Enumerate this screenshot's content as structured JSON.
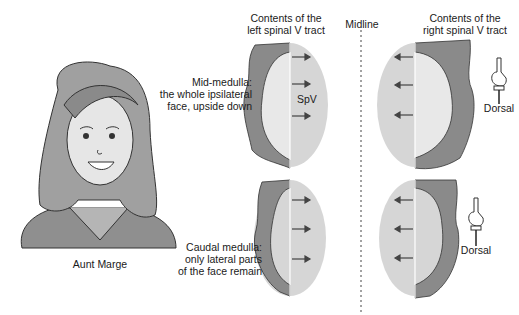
{
  "headers": {
    "left_tract": [
      "Contents of the",
      "left spinal V tract"
    ],
    "midline": "Midline",
    "right_tract": [
      "Contents of the",
      "right spinal V tract"
    ]
  },
  "rows": [
    {
      "label": [
        "Mid-medulla:",
        "the whole ipsilateral",
        "face, upside down"
      ],
      "nucleus_label": "SpV"
    },
    {
      "label": [
        "Caudal medulla:",
        "only lateral parts",
        "of the face remain"
      ]
    }
  ],
  "portrait_caption": "Aunt Marge",
  "orientation_labels": [
    "Dorsal",
    "Dorsal"
  ],
  "colors": {
    "nucleus_fill": "#d6d6d6",
    "hair_dark": "#7a7a7a",
    "hair_light": "#a8a8a8",
    "skin": "#e8e8e8",
    "line": "#3a3a3a"
  }
}
